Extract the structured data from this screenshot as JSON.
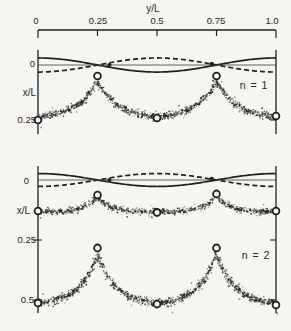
{
  "figure": {
    "background": "#f6f5f1",
    "ink": "#1f1f1f"
  },
  "chart_data": {
    "type": "line",
    "title": "",
    "top_axis": {
      "label": "y/L",
      "range": [
        0,
        1
      ],
      "ticks": [
        0,
        0.25,
        0.5,
        0.75,
        1.0
      ],
      "tick_labels": [
        "0",
        "0.25",
        "0.5",
        "0.75",
        "1.0"
      ]
    },
    "panels": [
      {
        "label": "n = 1",
        "ylabel": "x/L",
        "yticks": [
          {
            "value": 0,
            "label": "0"
          },
          {
            "value": 0.25,
            "label": "0.25"
          }
        ],
        "series": [
          {
            "name": "mode-shape-solid",
            "style": "solid",
            "type": "cosine",
            "amplitude": -0.032
          },
          {
            "name": "mode-shape-dashed",
            "style": "dashed",
            "type": "cosine",
            "amplitude": 0.032
          },
          {
            "name": "zero-line",
            "style": "thin",
            "type": "flat",
            "value": 0
          }
        ],
        "node_dots": [
          [
            0.3,
            0.0
          ],
          [
            0.73,
            -0.005
          ]
        ],
        "stippled_bands": [
          {
            "name": "interface-n1",
            "trough_x": 0.245,
            "peak_x": 0.073,
            "peak_positions": [
              0.25,
              0.75
            ],
            "sigma": 0.085,
            "peak_circles": [
              [
                0.25,
                0.05
              ],
              [
                0.75,
                0.05
              ]
            ],
            "trough_circles": [
              [
                0.0,
                0.25
              ],
              [
                0.5,
                0.241
              ],
              [
                1.0,
                0.232
              ]
            ]
          }
        ]
      },
      {
        "label": "n = 2",
        "ylabel": "x/L",
        "yticks": [
          {
            "value": 0,
            "label": "0"
          },
          {
            "value": 0.25,
            "label": "0.25"
          },
          {
            "value": 0.5,
            "label": "0.5"
          }
        ],
        "series": [
          {
            "name": "mode-shape-solid",
            "style": "solid",
            "type": "cosine",
            "amplitude": -0.027
          },
          {
            "name": "mode-shape-dashed",
            "style": "dashed",
            "type": "cosine",
            "amplitude": 0.027
          },
          {
            "name": "zero-line",
            "style": "thin",
            "type": "flat",
            "value": 0
          }
        ],
        "node_dots": [
          [
            0.3,
            0.0
          ],
          [
            0.73,
            -0.005
          ]
        ],
        "stippled_bands": [
          {
            "name": "interface-n2-early",
            "trough_x": 0.133,
            "peak_x": 0.067,
            "peak_positions": [
              0.25,
              0.75
            ],
            "sigma": 0.05,
            "peak_circles": [
              [
                0.25,
                0.063
              ],
              [
                0.75,
                0.058
              ]
            ],
            "trough_circles": [
              [
                0.0,
                0.129
              ],
              [
                0.5,
                0.135
              ],
              [
                1.0,
                0.129
              ]
            ]
          },
          {
            "name": "interface-n2-late",
            "trough_x": 0.52,
            "peak_x": 0.308,
            "peak_positions": [
              0.25,
              0.75
            ],
            "sigma": 0.075,
            "peak_circles": [
              [
                0.25,
                0.283
              ],
              [
                0.75,
                0.283
              ]
            ],
            "trough_circles": [
              [
                0.0,
                0.512
              ],
              [
                0.5,
                0.517
              ],
              [
                1.0,
                0.521
              ]
            ]
          }
        ]
      }
    ]
  }
}
